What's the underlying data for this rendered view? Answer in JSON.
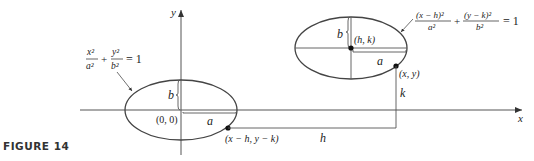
{
  "figure": {
    "caption": "FIGURE 14",
    "axes": {
      "x_label": "x",
      "y_label": "y"
    },
    "left_ellipse": {
      "equation": {
        "term1_num": "x²",
        "term1_den": "a²",
        "plus": "+",
        "term2_num": "y²",
        "term2_den": "b²",
        "equals": "= 1"
      },
      "center_label": "(0, 0)",
      "semi_minor_label": "b",
      "semi_major_label": "a",
      "point_label": "(x − h, y − k)"
    },
    "right_ellipse": {
      "equation": {
        "term1_num": "(x − h)²",
        "term1_den": "a²",
        "plus": "+",
        "term2_num": "(y − k)²",
        "term2_den": "b²",
        "equals": "= 1"
      },
      "center_label": "(h, k)",
      "semi_minor_label": "b",
      "semi_major_label": "a",
      "point_label": "(x, y)"
    },
    "translation": {
      "horizontal_label": "h",
      "vertical_label": "k"
    },
    "colors": {
      "stroke": "#444444",
      "text": "#222222",
      "background": "#ffffff"
    }
  }
}
